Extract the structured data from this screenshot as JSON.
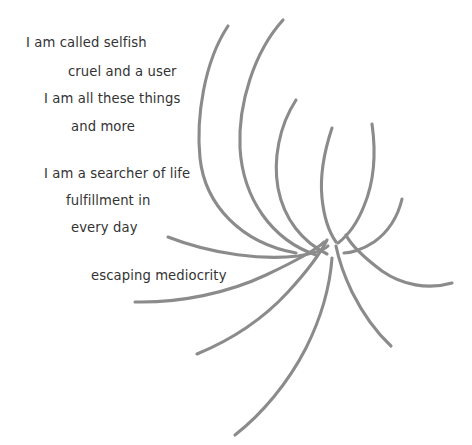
{
  "canvas": {
    "width": 472,
    "height": 445,
    "background_color": "#ffffff"
  },
  "poem": {
    "text_color": "#333333",
    "lines": [
      {
        "text": "I am called selfish"
      },
      {
        "text": "cruel and a user"
      },
      {
        "text": "I am all these things"
      },
      {
        "text": "and more"
      },
      {
        "text": "I am a searcher of life"
      },
      {
        "text": "fulfillment in"
      },
      {
        "text": "every day"
      },
      {
        "text": "escaping mediocrity"
      }
    ]
  },
  "artwork": {
    "name": "spiral-swirl",
    "stroke_color": "#8b8b8b",
    "stroke_width": 3.1,
    "center": {
      "x": 330,
      "y": 232
    },
    "arc_count": 12,
    "arcs": [
      {
        "d": "M 228 26 C 204 62 196 118 200 158 C 205 205 241 243 296 253"
      },
      {
        "d": "M 283 20 C 254 52 238 104 240 148 C 243 199 272 240 316 255"
      },
      {
        "d": "M 296 100 C 279 126 273 160 278 188 C 284 220 303 242 327 254"
      },
      {
        "d": "M 332 128 C 324 152 320 178 322 198 C 324 218 329 232 336 242"
      },
      {
        "d": "M 372 124 C 376 152 374 182 364 206 C 356 226 346 237 338 243"
      },
      {
        "d": "M 402 199 C 398 216 388 232 374 242 C 362 250 350 253 344 253"
      },
      {
        "d": "M 452 283 C 428 290 402 285 382 271 C 362 256 350 243 346 235"
      },
      {
        "d": "M 391 346 C 376 332 362 312 352 292 C 343 273 338 256 336 246"
      },
      {
        "d": "M 235 435 C 262 414 288 383 306 348 C 322 316 330 285 332 258"
      },
      {
        "d": "M 197 354 C 231 340 264 318 288 292 C 310 268 322 250 327 240"
      },
      {
        "d": "M 135 302 C 180 303 228 293 266 275 C 300 259 318 248 324 242"
      },
      {
        "d": "M 168 237 C 214 255 264 260 298 256 C 316 253 325 249 328 246"
      }
    ]
  }
}
